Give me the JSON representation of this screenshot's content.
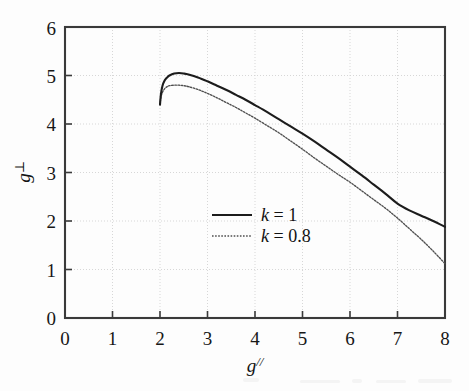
{
  "chart_data": {
    "type": "line",
    "title": "",
    "xlabel": "g//",
    "ylabel": "g⊥",
    "xlim": [
      0,
      8
    ],
    "ylim": [
      0,
      6
    ],
    "grid": true,
    "legend_position": "center",
    "xticks": [
      "0",
      "1",
      "2",
      "3",
      "4",
      "5",
      "6",
      "7",
      "8"
    ],
    "yticks": [
      "0",
      "1",
      "2",
      "3",
      "4",
      "5",
      "6"
    ],
    "series": [
      {
        "name": "k = 1",
        "style": "solid",
        "color": "#1c1c1c",
        "x": [
          2.0,
          2.02,
          2.05,
          2.1,
          2.15,
          2.2,
          2.3,
          2.4,
          2.5,
          2.6,
          2.8,
          3.0,
          3.2,
          3.4,
          3.6,
          3.8,
          4.0,
          4.25,
          4.5,
          4.75,
          5.0,
          5.25,
          5.5,
          5.75,
          6.0,
          6.25,
          6.5,
          6.75,
          7.0,
          7.25,
          7.5,
          7.75,
          8.0
        ],
        "y": [
          4.4,
          4.62,
          4.78,
          4.9,
          4.96,
          5.0,
          5.04,
          5.05,
          5.04,
          5.02,
          4.96,
          4.88,
          4.79,
          4.7,
          4.6,
          4.5,
          4.39,
          4.25,
          4.1,
          3.95,
          3.8,
          3.64,
          3.47,
          3.3,
          3.12,
          2.94,
          2.75,
          2.56,
          2.36,
          2.22,
          2.11,
          2.0,
          1.88
        ]
      },
      {
        "name": "k = 0.8",
        "style": "dotted",
        "color": "#4f4f4f",
        "x": [
          2.0,
          2.02,
          2.05,
          2.1,
          2.15,
          2.2,
          2.3,
          2.4,
          2.5,
          2.6,
          2.8,
          3.0,
          3.2,
          3.4,
          3.6,
          3.8,
          4.0,
          4.25,
          4.5,
          4.75,
          5.0,
          5.25,
          5.5,
          5.75,
          6.0,
          6.25,
          6.5,
          6.75,
          7.0,
          7.25,
          7.5,
          7.75,
          8.0
        ],
        "y": [
          4.4,
          4.55,
          4.65,
          4.73,
          4.77,
          4.79,
          4.8,
          4.8,
          4.79,
          4.77,
          4.71,
          4.63,
          4.54,
          4.44,
          4.34,
          4.23,
          4.12,
          3.97,
          3.82,
          3.65,
          3.48,
          3.3,
          3.13,
          2.96,
          2.8,
          2.62,
          2.44,
          2.26,
          2.06,
          1.84,
          1.62,
          1.38,
          1.12
        ]
      }
    ],
    "annotations": []
  },
  "legend": {
    "entries": [
      {
        "label_var": "k",
        "label_rest": " = 1"
      },
      {
        "label_var": "k",
        "label_rest": " = 0.8"
      }
    ]
  },
  "axis": {
    "y_title_var": "g",
    "y_title_sup": "⊥",
    "x_title_var": "g",
    "x_title_sup": "//"
  }
}
